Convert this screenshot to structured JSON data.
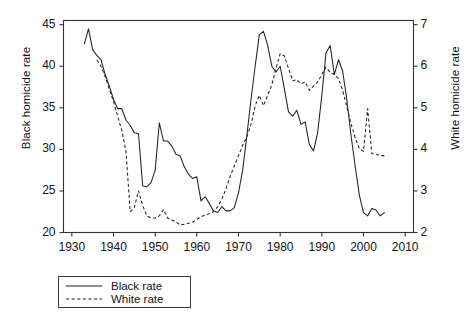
{
  "chart_data": {
    "type": "line",
    "title": "",
    "xlabel": "",
    "ylabel": "Black homicide rate",
    "ylabel_right": "White homicide rate",
    "xlim": [
      1928,
      2012
    ],
    "ylim": [
      20,
      45.5
    ],
    "ylim_right": [
      2,
      7.1
    ],
    "xticks": [
      1930,
      1940,
      1950,
      1960,
      1970,
      1980,
      1990,
      2000,
      2010
    ],
    "yticks_left": [
      20,
      25,
      30,
      35,
      40,
      45
    ],
    "yticks_right": [
      2,
      3,
      4,
      5,
      6,
      7
    ],
    "grid": false,
    "legend_position": "below-left",
    "series": [
      {
        "name": "Black rate",
        "axis": "left",
        "style": "solid",
        "color": "#222222",
        "x": [
          1933,
          1934,
          1935,
          1936,
          1937,
          1938,
          1939,
          1940,
          1941,
          1942,
          1943,
          1944,
          1945,
          1946,
          1947,
          1948,
          1949,
          1950,
          1951,
          1952,
          1953,
          1954,
          1955,
          1956,
          1957,
          1958,
          1959,
          1960,
          1961,
          1962,
          1963,
          1964,
          1965,
          1966,
          1967,
          1968,
          1969,
          1970,
          1971,
          1972,
          1973,
          1974,
          1975,
          1976,
          1977,
          1978,
          1979,
          1980,
          1981,
          1982,
          1983,
          1984,
          1985,
          1986,
          1987,
          1988,
          1989,
          1990,
          1991,
          1992,
          1993,
          1994,
          1995,
          1996,
          1997,
          1998,
          1999,
          2000,
          2001,
          2002,
          2003,
          2004,
          2005
        ],
        "values": [
          42.7,
          44.5,
          42.0,
          41.3,
          40.8,
          39.0,
          37.6,
          36.0,
          34.9,
          34.9,
          33.5,
          32.9,
          32.0,
          31.9,
          25.6,
          25.5,
          26.0,
          27.5,
          33.2,
          31.0,
          31.0,
          30.4,
          29.4,
          29.2,
          27.9,
          27.0,
          26.5,
          26.7,
          23.8,
          24.3,
          23.5,
          22.6,
          22.4,
          23.1,
          22.6,
          22.6,
          23.0,
          24.8,
          27.5,
          31.6,
          36.0,
          40.0,
          43.8,
          44.2,
          42.5,
          40.0,
          39.3,
          40.0,
          37.3,
          34.5,
          34.0,
          34.7,
          33.0,
          33.3,
          30.6,
          29.8,
          32.0,
          36.5,
          41.6,
          42.5,
          39.0,
          40.8,
          39.4,
          36.0,
          31.7,
          28.0,
          24.5,
          22.4,
          22.0,
          22.9,
          22.7,
          22.0,
          22.4
        ]
      },
      {
        "name": "White rate",
        "axis": "right",
        "style": "dashed",
        "color": "#222222",
        "x": [
          1936,
          1937,
          1938,
          1939,
          1940,
          1941,
          1942,
          1943,
          1944,
          1945,
          1946,
          1947,
          1948,
          1949,
          1950,
          1951,
          1952,
          1953,
          1954,
          1955,
          1956,
          1957,
          1958,
          1959,
          1960,
          1961,
          1962,
          1963,
          1964,
          1965,
          1966,
          1967,
          1968,
          1969,
          1970,
          1971,
          1972,
          1973,
          1974,
          1975,
          1976,
          1977,
          1978,
          1979,
          1980,
          1981,
          1982,
          1983,
          1984,
          1985,
          1986,
          1987,
          1988,
          1989,
          1990,
          1991,
          1992,
          1993,
          1994,
          1995,
          1996,
          1997,
          1998,
          1999,
          2000,
          2001,
          2002,
          2003,
          2004,
          2005
        ],
        "values": [
          6.15,
          6.0,
          5.75,
          5.45,
          5.15,
          4.8,
          4.45,
          3.95,
          2.5,
          2.6,
          3.0,
          2.65,
          2.4,
          2.35,
          2.35,
          2.4,
          2.55,
          2.35,
          2.3,
          2.25,
          2.18,
          2.2,
          2.22,
          2.25,
          2.32,
          2.38,
          2.42,
          2.45,
          2.5,
          2.62,
          2.8,
          3.05,
          3.35,
          3.6,
          3.85,
          4.1,
          4.3,
          4.6,
          5.05,
          5.3,
          5.05,
          5.3,
          5.55,
          5.95,
          6.3,
          6.25,
          5.95,
          5.65,
          5.68,
          5.58,
          5.62,
          5.42,
          5.52,
          5.62,
          5.8,
          5.98,
          5.85,
          5.8,
          5.7,
          5.42,
          5.02,
          4.62,
          4.28,
          4.02,
          3.95,
          4.98,
          3.9,
          3.88,
          3.85,
          3.85
        ]
      }
    ]
  },
  "legend": {
    "entries": [
      {
        "label": "Black rate",
        "style": "solid"
      },
      {
        "label": "White rate",
        "style": "dashed"
      }
    ]
  }
}
